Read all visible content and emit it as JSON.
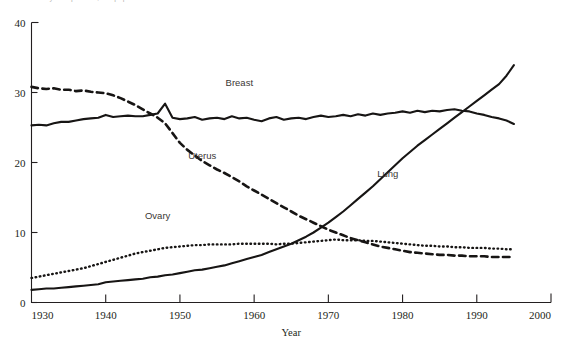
{
  "figure": {
    "caption_clipped": "Mortality rate per 100,000 population",
    "caption_visible": false
  },
  "chart_data": {
    "type": "line",
    "title": "",
    "subtitle": "",
    "xlabel": "Year",
    "ylabel": "",
    "xlim": [
      1930,
      2000
    ],
    "ylim": [
      0,
      40
    ],
    "xticks": [
      1930,
      1940,
      1950,
      1960,
      1970,
      1980,
      1990,
      2000
    ],
    "yticks": [
      0,
      10,
      20,
      30,
      40
    ],
    "xtick_labels": [
      "1930",
      "1940",
      "1950",
      "1960",
      "1970",
      "1980",
      "1990",
      "2000"
    ],
    "ytick_labels": [
      "0",
      "10",
      "20",
      "30",
      "40"
    ],
    "grid": false,
    "legend": "inline-annotations",
    "annotations": [
      {
        "text": "Breast",
        "x": 1958,
        "y": 31.0
      },
      {
        "text": "Uterus",
        "x": 1953,
        "y": 20.5
      },
      {
        "text": "Lung",
        "x": 1978,
        "y": 18.0
      },
      {
        "text": "Ovary",
        "x": 1947,
        "y": 12.0
      }
    ],
    "x": [
      1930,
      1931,
      1932,
      1933,
      1934,
      1935,
      1936,
      1937,
      1938,
      1939,
      1940,
      1941,
      1942,
      1943,
      1944,
      1945,
      1946,
      1947,
      1948,
      1949,
      1950,
      1951,
      1952,
      1953,
      1954,
      1955,
      1956,
      1957,
      1958,
      1959,
      1960,
      1961,
      1962,
      1963,
      1964,
      1965,
      1966,
      1967,
      1968,
      1969,
      1970,
      1971,
      1972,
      1973,
      1974,
      1975,
      1976,
      1977,
      1978,
      1979,
      1980,
      1981,
      1982,
      1983,
      1984,
      1985,
      1986,
      1987,
      1988,
      1989,
      1990,
      1991,
      1992,
      1993,
      1994,
      1995
    ],
    "series": [
      {
        "name": "Breast",
        "style": "solid",
        "values": [
          25.3,
          25.4,
          25.3,
          25.6,
          25.8,
          25.8,
          26.0,
          26.2,
          26.3,
          26.4,
          26.8,
          26.5,
          26.6,
          26.7,
          26.6,
          26.6,
          26.8,
          27.0,
          28.4,
          26.4,
          26.2,
          26.3,
          26.5,
          26.1,
          26.3,
          26.4,
          26.2,
          26.6,
          26.3,
          26.4,
          26.1,
          25.9,
          26.3,
          26.5,
          26.1,
          26.3,
          26.4,
          26.2,
          26.5,
          26.7,
          26.5,
          26.6,
          26.8,
          26.6,
          26.9,
          26.7,
          27.0,
          26.8,
          27.0,
          27.1,
          27.3,
          27.1,
          27.4,
          27.2,
          27.4,
          27.3,
          27.5,
          27.6,
          27.4,
          27.3,
          27.0,
          26.8,
          26.5,
          26.3,
          26.0,
          25.5
        ]
      },
      {
        "name": "Uterus",
        "style": "dashed",
        "values": [
          30.8,
          30.6,
          30.5,
          30.6,
          30.4,
          30.4,
          30.2,
          30.3,
          30.1,
          30.0,
          29.9,
          29.6,
          29.2,
          28.7,
          28.2,
          27.6,
          27.0,
          26.4,
          25.6,
          24.2,
          22.8,
          21.8,
          21.0,
          20.2,
          19.6,
          19.0,
          18.5,
          17.9,
          17.3,
          16.6,
          16.0,
          15.4,
          14.8,
          14.2,
          13.6,
          13.0,
          12.4,
          11.9,
          11.4,
          10.9,
          10.4,
          10.0,
          9.6,
          9.2,
          8.9,
          8.6,
          8.3,
          8.0,
          7.8,
          7.6,
          7.4,
          7.2,
          7.1,
          7.0,
          6.9,
          6.8,
          6.8,
          6.7,
          6.7,
          6.6,
          6.6,
          6.6,
          6.5,
          6.5,
          6.5,
          6.5
        ]
      },
      {
        "name": "Ovary",
        "style": "dotted",
        "values": [
          3.5,
          3.7,
          3.9,
          4.1,
          4.3,
          4.5,
          4.7,
          4.9,
          5.2,
          5.5,
          5.8,
          6.1,
          6.4,
          6.7,
          7.0,
          7.2,
          7.4,
          7.6,
          7.8,
          7.9,
          8.0,
          8.1,
          8.2,
          8.2,
          8.3,
          8.3,
          8.3,
          8.3,
          8.4,
          8.4,
          8.4,
          8.4,
          8.4,
          8.3,
          8.4,
          8.4,
          8.5,
          8.6,
          8.7,
          8.8,
          8.9,
          9.0,
          8.9,
          8.9,
          8.9,
          8.8,
          8.8,
          8.7,
          8.6,
          8.5,
          8.4,
          8.3,
          8.2,
          8.1,
          8.1,
          8.0,
          8.0,
          7.9,
          7.9,
          7.8,
          7.8,
          7.8,
          7.7,
          7.7,
          7.6,
          7.6
        ]
      },
      {
        "name": "Lung",
        "style": "solid",
        "values": [
          1.8,
          1.9,
          2.0,
          2.0,
          2.1,
          2.2,
          2.3,
          2.4,
          2.5,
          2.6,
          2.9,
          3.0,
          3.1,
          3.2,
          3.3,
          3.4,
          3.6,
          3.7,
          3.9,
          4.0,
          4.2,
          4.4,
          4.6,
          4.7,
          4.9,
          5.1,
          5.3,
          5.6,
          5.9,
          6.2,
          6.5,
          6.8,
          7.2,
          7.6,
          8.0,
          8.4,
          8.9,
          9.4,
          10.0,
          10.7,
          11.4,
          12.2,
          13.0,
          13.9,
          14.8,
          15.7,
          16.6,
          17.6,
          18.6,
          19.6,
          20.6,
          21.5,
          22.4,
          23.2,
          24.0,
          24.8,
          25.6,
          26.4,
          27.2,
          28.0,
          28.8,
          29.6,
          30.4,
          31.2,
          32.4,
          33.9
        ]
      }
    ]
  }
}
